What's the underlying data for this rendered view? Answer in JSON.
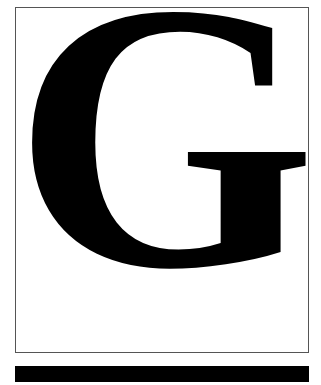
{
  "glyph": {
    "letter": "G",
    "color": "#000000"
  },
  "frame": {
    "border_color": "#555555",
    "background": "#ffffff"
  },
  "bar": {
    "color": "#000000"
  }
}
